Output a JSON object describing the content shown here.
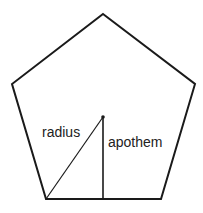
{
  "diagram": {
    "shape": "pentagon",
    "stroke_color": "#1a1a1a",
    "background": "#ffffff",
    "vertices": [
      {
        "x": 103,
        "y": 14
      },
      {
        "x": 195,
        "y": 84
      },
      {
        "x": 161,
        "y": 199
      },
      {
        "x": 46,
        "y": 199
      },
      {
        "x": 12,
        "y": 84
      }
    ],
    "center": {
      "x": 103,
      "y": 117
    },
    "segments": [
      {
        "name": "radius",
        "from": {
          "x": 103,
          "y": 117
        },
        "to": {
          "x": 46,
          "y": 199
        }
      },
      {
        "name": "apothem",
        "from": {
          "x": 103,
          "y": 117
        },
        "to": {
          "x": 103,
          "y": 199
        }
      }
    ],
    "labels": {
      "radius": "radius",
      "apothem": "apothem"
    }
  }
}
